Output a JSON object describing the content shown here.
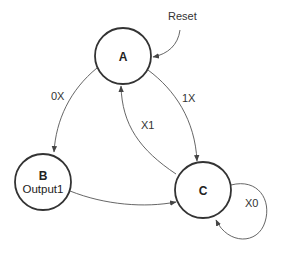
{
  "diagram": {
    "type": "state-machine",
    "states": [
      {
        "id": "A",
        "name": "A",
        "output": ""
      },
      {
        "id": "B",
        "name": "B",
        "output": "Output1"
      },
      {
        "id": "C",
        "name": "C",
        "output": ""
      }
    ],
    "transitions": [
      {
        "from": "Reset",
        "to": "A",
        "label": "Reset"
      },
      {
        "from": "A",
        "to": "B",
        "label": "0X"
      },
      {
        "from": "A",
        "to": "C",
        "label": "1X"
      },
      {
        "from": "C",
        "to": "A",
        "label": "X1"
      },
      {
        "from": "B",
        "to": "C",
        "label": ""
      },
      {
        "from": "C",
        "to": "C",
        "label": "X0"
      }
    ],
    "labels": {
      "reset": "Reset",
      "a_to_b": "0X",
      "a_to_c": "1X",
      "c_to_a": "X1",
      "c_self": "X0"
    },
    "colors": {
      "stroke": "#333333",
      "edge": "#555555",
      "text": "#222222"
    }
  }
}
